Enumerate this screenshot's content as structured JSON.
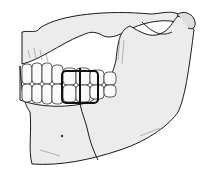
{
  "image": {
    "subject": "mandible-fracture-illustration",
    "colors": {
      "background": "#ffffff",
      "bone": "#ececec",
      "bone_shadow": "#d6d6d6",
      "line": "#1a1a1a",
      "teeth": "#fafafa"
    }
  }
}
